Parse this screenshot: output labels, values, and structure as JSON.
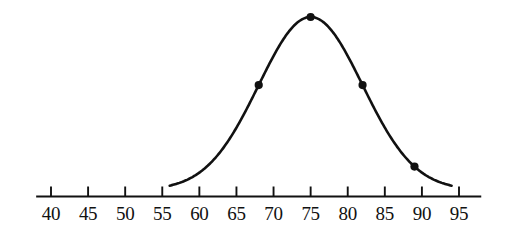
{
  "figure": {
    "background_color": "#ffffff",
    "ink_color": "#111111"
  },
  "chart_data": {
    "type": "line",
    "title": "",
    "subtitle": "",
    "xlabel": "",
    "ylabel": "",
    "curve_kind": "normal-distribution-bell-curve",
    "mean": 75,
    "std_dev": 7,
    "xlim": [
      40,
      95
    ],
    "ylim": [
      0,
      1
    ],
    "grid": false,
    "legend": null,
    "axis": {
      "orientation": "horizontal",
      "line_start_value": 38,
      "line_end_value": 98,
      "tick_values": [
        40,
        45,
        50,
        55,
        60,
        65,
        70,
        75,
        80,
        85,
        90,
        95
      ],
      "tick_labels": [
        "40",
        "45",
        "50",
        "55",
        "60",
        "65",
        "70",
        "75",
        "80",
        "85",
        "90",
        "95"
      ],
      "tick_step": 5,
      "tick_direction": "up"
    },
    "curve": {
      "x_start": 56,
      "x_end": 94,
      "peak_x": 75,
      "peak_y": 1.0
    },
    "points": [
      {
        "label": "minus-two-sigma-ish",
        "x": 89,
        "y": 0.05
      },
      {
        "label": "minus-one-sigma",
        "x": 68,
        "y": 0.607
      },
      {
        "label": "mean-peak",
        "x": 75,
        "y": 1.0
      },
      {
        "label": "plus-one-sigma",
        "x": 82,
        "y": 0.607
      }
    ],
    "marked_x_values": [
      68,
      75,
      82,
      89
    ],
    "series": [
      {
        "name": "normal-density",
        "x": [
          56,
          58,
          60,
          62,
          64,
          66,
          68,
          70,
          72,
          74,
          75,
          76,
          78,
          80,
          82,
          84,
          86,
          88,
          90,
          92,
          94
        ],
        "values": [
          0.021,
          0.04,
          0.071,
          0.119,
          0.186,
          0.273,
          0.377,
          0.488,
          0.593,
          0.677,
          0.705,
          0.719,
          0.7,
          0.632,
          0.528,
          0.41,
          0.295,
          0.197,
          0.122,
          0.07,
          0.037
        ]
      }
    ]
  }
}
